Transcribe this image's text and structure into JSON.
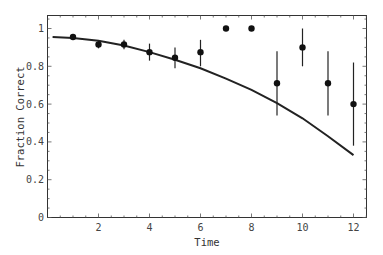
{
  "chart_data": {
    "type": "scatter",
    "title": "",
    "xlabel": "Time",
    "ylabel": "Fraction Correct",
    "xlim": [
      0,
      12.5
    ],
    "ylim": [
      0,
      1.06
    ],
    "grid": false,
    "legend": null,
    "x_ticks": [
      2,
      4,
      6,
      8,
      10,
      12
    ],
    "x_tick_labels": [
      "2",
      "4",
      "6",
      "8",
      "10",
      "12"
    ],
    "y_ticks": [
      0,
      0.2,
      0.4,
      0.6,
      0.8,
      1
    ],
    "y_tick_labels": [
      "0",
      "0.2",
      "0.4",
      "0.6",
      "0.8",
      "1"
    ],
    "series": [
      {
        "name": "observed",
        "kind": "points_with_error_bars",
        "x": [
          1,
          2,
          3,
          4,
          5,
          6,
          7,
          8,
          9,
          10,
          11,
          12
        ],
        "y": [
          0.955,
          0.915,
          0.915,
          0.875,
          0.845,
          0.875,
          1.0,
          1.0,
          0.71,
          0.9,
          0.71,
          0.6
        ],
        "err_low": [
          0.94,
          0.895,
          0.89,
          0.83,
          0.79,
          0.8,
          1.0,
          1.0,
          0.54,
          0.8,
          0.54,
          0.38
        ],
        "err_high": [
          0.97,
          0.935,
          0.94,
          0.92,
          0.9,
          0.94,
          1.0,
          1.0,
          0.88,
          1.0,
          0.88,
          0.82
        ]
      },
      {
        "name": "model",
        "kind": "line",
        "x": [
          0.2,
          1,
          2,
          3,
          4,
          5,
          6,
          7,
          8,
          9,
          10,
          11,
          12
        ],
        "y": [
          0.955,
          0.95,
          0.935,
          0.91,
          0.875,
          0.835,
          0.79,
          0.735,
          0.675,
          0.605,
          0.525,
          0.43,
          0.33
        ]
      }
    ]
  }
}
